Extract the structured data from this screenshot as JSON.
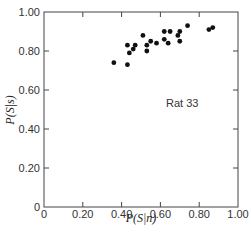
{
  "chart_data": {
    "type": "scatter",
    "title": "",
    "xlabel": "P(S|n)",
    "ylabel": "P(S|s)",
    "xlim": [
      0,
      1.0
    ],
    "ylim": [
      0,
      1.0
    ],
    "x_ticks": [
      "0",
      "0.20",
      "0.40",
      "0.60",
      "0.80",
      "1.00"
    ],
    "y_ticks": [
      "0",
      "0.20",
      "0.40",
      "0.60",
      "0.80",
      "1.00"
    ],
    "grid": false,
    "legend": null,
    "annotations": [
      {
        "text": "Rat 33",
        "x": 0.72,
        "y": 0.61
      }
    ],
    "series": [
      {
        "name": "Rat 33",
        "color": "#111111",
        "points": [
          {
            "x": 0.36,
            "y": 0.74
          },
          {
            "x": 0.43,
            "y": 0.73
          },
          {
            "x": 0.43,
            "y": 0.83
          },
          {
            "x": 0.44,
            "y": 0.79
          },
          {
            "x": 0.46,
            "y": 0.81
          },
          {
            "x": 0.47,
            "y": 0.83
          },
          {
            "x": 0.51,
            "y": 0.88
          },
          {
            "x": 0.53,
            "y": 0.83
          },
          {
            "x": 0.53,
            "y": 0.8
          },
          {
            "x": 0.55,
            "y": 0.85
          },
          {
            "x": 0.58,
            "y": 0.84
          },
          {
            "x": 0.62,
            "y": 0.9
          },
          {
            "x": 0.62,
            "y": 0.86
          },
          {
            "x": 0.64,
            "y": 0.84
          },
          {
            "x": 0.65,
            "y": 0.9
          },
          {
            "x": 0.69,
            "y": 0.88
          },
          {
            "x": 0.7,
            "y": 0.9
          },
          {
            "x": 0.7,
            "y": 0.85
          },
          {
            "x": 0.74,
            "y": 0.93
          },
          {
            "x": 0.85,
            "y": 0.91
          },
          {
            "x": 0.87,
            "y": 0.92
          }
        ]
      }
    ]
  },
  "labels": {
    "xlabel": "P(S|n)",
    "ylabel": "P(S|s)",
    "annotation": "Rat 33",
    "caption_fragment": "... 13.3 ROC ..."
  }
}
